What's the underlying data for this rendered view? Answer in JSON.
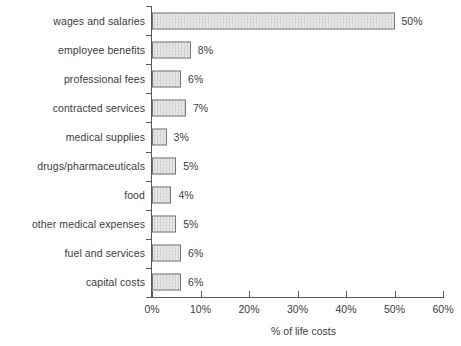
{
  "chart_data": {
    "type": "bar",
    "orientation": "horizontal",
    "title": "",
    "xlabel": "% of life costs",
    "ylabel": "",
    "xlim": [
      0,
      60
    ],
    "xticks": [
      "0%",
      "10%",
      "20%",
      "30%",
      "40%",
      "50%",
      "60%"
    ],
    "xtick_values": [
      0,
      10,
      20,
      30,
      40,
      50,
      60
    ],
    "grid": false,
    "legend": "none",
    "categories": [
      "wages and salaries",
      "employee benefits",
      "professional fees",
      "contracted services",
      "medical supplies",
      "drugs/pharmaceuticals",
      "food",
      "other medical expenses",
      "fuel and services",
      "capital costs"
    ],
    "values": [
      50,
      8,
      6,
      7,
      3,
      5,
      4,
      5,
      6,
      6
    ],
    "value_labels": [
      "50%",
      "8%",
      "6%",
      "7%",
      "3%",
      "5%",
      "4%",
      "5%",
      "6%",
      "6%"
    ],
    "colors": {
      "bar_fill": "#e2e2e2",
      "bar_edge": "#75757a",
      "axis": "#59595b",
      "text": "#3b3b3d",
      "background": "#ffffff"
    }
  }
}
